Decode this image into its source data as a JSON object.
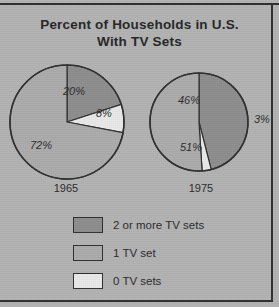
{
  "chart_data": {
    "type": "pie",
    "title": "Percent of Households in U.S. With TV Sets",
    "title_line1": "Percent of Households in U.S.",
    "title_line2": "With TV Sets",
    "xlabel": "",
    "ylabel": "",
    "legend_position": "bottom",
    "grid": false,
    "categories": [
      "2 or more TV sets",
      "1 TV set",
      "0 TV sets"
    ],
    "colors": [
      "#8d8d8d",
      "#ababab",
      "#e9e9e9"
    ],
    "charts": [
      {
        "name": "1965",
        "year_label": "1965",
        "values": [
          20,
          72,
          8
        ],
        "slices": [
          {
            "label": "20%",
            "value": 20,
            "category": "2 or more TV sets",
            "color": "#8d8d8d"
          },
          {
            "label": "8%",
            "value": 8,
            "category": "0 TV sets",
            "color": "#e9e9e9"
          },
          {
            "label": "72%",
            "value": 72,
            "category": "1 TV set",
            "color": "#ababab"
          }
        ]
      },
      {
        "name": "1975",
        "year_label": "1975",
        "values": [
          46,
          51,
          3
        ],
        "slices": [
          {
            "label": "46%",
            "value": 46,
            "category": "2 or more TV sets",
            "color": "#8d8d8d"
          },
          {
            "label": "3%",
            "value": 3,
            "category": "0 TV sets",
            "color": "#e9e9e9"
          },
          {
            "label": "51%",
            "value": 51,
            "category": "1 TV set",
            "color": "#ababab"
          }
        ]
      }
    ]
  },
  "legend": {
    "items": [
      {
        "label": "2 or more TV sets",
        "color": "#8d8d8d"
      },
      {
        "label": "1 TV set",
        "color": "#ababab"
      },
      {
        "label": "0 TV sets",
        "color": "#e9e9e9"
      }
    ]
  },
  "colors": {
    "background": "#b2b2b2",
    "ink": "#2b2b2b",
    "outline": "#2f2f2f",
    "two_or_more": "#8d8d8d",
    "one_set": "#ababab",
    "zero_sets": "#e9e9e9"
  }
}
